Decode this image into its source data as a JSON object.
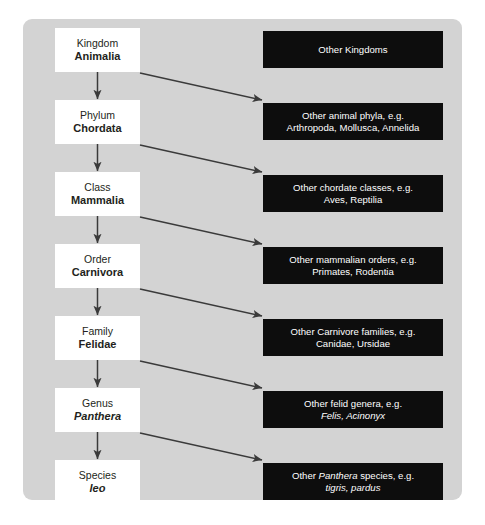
{
  "diagram": {
    "panel_color": "#d3d3d3",
    "rank_box_color": "#ffffff",
    "other_box_color": "#0d0d0d",
    "arrow_color": "#3a3a3a",
    "ranks": [
      {
        "rank": "Kingdom",
        "taxon": "Animalia",
        "italic": false
      },
      {
        "rank": "Phylum",
        "taxon": "Chordata",
        "italic": false
      },
      {
        "rank": "Class",
        "taxon": "Mammalia",
        "italic": false
      },
      {
        "rank": "Order",
        "taxon": "Carnivora",
        "italic": false
      },
      {
        "rank": "Family",
        "taxon": "Felidae",
        "italic": false
      },
      {
        "rank": "Genus",
        "taxon": "Panthera",
        "italic": true
      },
      {
        "rank": "Species",
        "taxon": "leo",
        "italic": true
      }
    ],
    "others": [
      {
        "line1": "Other Kingdoms",
        "line2": ""
      },
      {
        "line1": "Other animal phyla, e.g.",
        "line2": "Arthropoda, Mollusca, Annelida"
      },
      {
        "line1": "Other chordate classes, e.g.",
        "line2": "Aves, Reptilia"
      },
      {
        "line1": "Other mammalian orders, e.g.",
        "line2": "Primates, Rodentia"
      },
      {
        "line1": "Other Carnivore families, e.g.",
        "line2": "Canidae, Ursidae"
      },
      {
        "line1": "Other felid genera, e.g.",
        "line2": "Felis, Acinonyx"
      },
      {
        "line1": "Other Panthera species, e.g.",
        "line2": "tigris, pardus"
      }
    ]
  }
}
